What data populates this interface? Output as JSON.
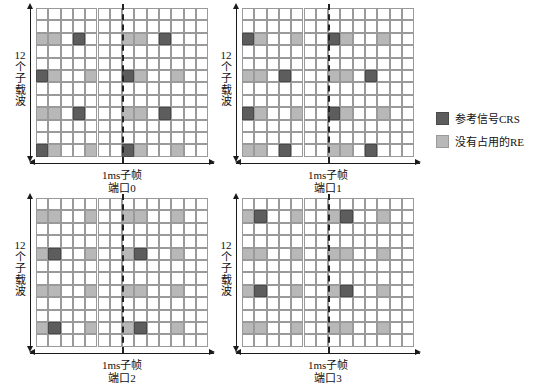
{
  "figure": {
    "subcarrier_count": 12,
    "symbol_count": 14,
    "colors": {
      "crs": "#5d5d5d",
      "free": "#b8b8b8",
      "empty": "#ffffff",
      "gridline": "#9a9a9a",
      "axis": "#1a1a1a",
      "divider": "#222222"
    }
  },
  "legend": {
    "items": [
      {
        "swatch": "crs",
        "label": "参考信号CRS"
      },
      {
        "swatch": "free",
        "label": "没有占用的RE"
      }
    ]
  },
  "axis_labels": {
    "y": "12个子载波",
    "y_chars": [
      "12",
      "个",
      "子",
      "载",
      "波"
    ],
    "x": "1ms子帧"
  },
  "chart_data": {
    "type": "heatmap",
    "xlabel": "1ms子帧",
    "ylabel": "12个子载波",
    "legend_position": "right",
    "grid": true,
    "cols": 14,
    "rows": 12,
    "col_axis": "OFDM symbol index (0-13)",
    "row_axis": "subcarrier index (row 0 = top)",
    "cell_states": [
      "empty",
      "free",
      "crs"
    ],
    "divider_after_col": 7,
    "panels": [
      {
        "id": "port0",
        "label": "端口0",
        "position": "top-left",
        "crs_cells": [
          [
            2,
            3
          ],
          [
            2,
            10
          ],
          [
            5,
            0
          ],
          [
            5,
            7
          ],
          [
            8,
            3
          ],
          [
            8,
            10
          ],
          [
            11,
            0
          ],
          [
            11,
            7
          ]
        ],
        "free_cells": [
          [
            2,
            0
          ],
          [
            2,
            1
          ],
          [
            2,
            7
          ],
          [
            2,
            8
          ],
          [
            5,
            1
          ],
          [
            5,
            4
          ],
          [
            5,
            8
          ],
          [
            5,
            11
          ],
          [
            8,
            0
          ],
          [
            8,
            1
          ],
          [
            8,
            7
          ],
          [
            8,
            8
          ],
          [
            11,
            1
          ],
          [
            11,
            4
          ],
          [
            11,
            8
          ],
          [
            11,
            11
          ]
        ]
      },
      {
        "id": "port1",
        "label": "端口1",
        "position": "top-right",
        "crs_cells": [
          [
            2,
            0
          ],
          [
            2,
            7
          ],
          [
            5,
            3
          ],
          [
            5,
            10
          ],
          [
            8,
            0
          ],
          [
            8,
            7
          ],
          [
            11,
            3
          ],
          [
            11,
            10
          ]
        ],
        "free_cells": [
          [
            2,
            1
          ],
          [
            2,
            4
          ],
          [
            2,
            8
          ],
          [
            2,
            11
          ],
          [
            5,
            0
          ],
          [
            5,
            1
          ],
          [
            5,
            7
          ],
          [
            5,
            8
          ],
          [
            8,
            1
          ],
          [
            8,
            4
          ],
          [
            8,
            8
          ],
          [
            8,
            11
          ],
          [
            11,
            0
          ],
          [
            11,
            1
          ],
          [
            11,
            7
          ],
          [
            11,
            8
          ]
        ]
      },
      {
        "id": "port2",
        "label": "端口2",
        "position": "bottom-left",
        "crs_cells": [
          [
            4,
            1
          ],
          [
            4,
            8
          ],
          [
            10,
            1
          ],
          [
            10,
            8
          ]
        ],
        "free_cells": [
          [
            1,
            0
          ],
          [
            1,
            1
          ],
          [
            1,
            4
          ],
          [
            1,
            7
          ],
          [
            1,
            8
          ],
          [
            1,
            11
          ],
          [
            4,
            0
          ],
          [
            4,
            4
          ],
          [
            4,
            7
          ],
          [
            4,
            11
          ],
          [
            7,
            0
          ],
          [
            7,
            1
          ],
          [
            7,
            4
          ],
          [
            7,
            7
          ],
          [
            7,
            8
          ],
          [
            7,
            11
          ],
          [
            10,
            0
          ],
          [
            10,
            4
          ],
          [
            10,
            7
          ],
          [
            10,
            11
          ]
        ]
      },
      {
        "id": "port3",
        "label": "端口3",
        "position": "bottom-right",
        "crs_cells": [
          [
            1,
            1
          ],
          [
            1,
            8
          ],
          [
            7,
            1
          ],
          [
            7,
            8
          ]
        ],
        "free_cells": [
          [
            1,
            0
          ],
          [
            1,
            4
          ],
          [
            1,
            7
          ],
          [
            1,
            11
          ],
          [
            4,
            0
          ],
          [
            4,
            1
          ],
          [
            4,
            4
          ],
          [
            4,
            7
          ],
          [
            4,
            8
          ],
          [
            4,
            11
          ],
          [
            7,
            0
          ],
          [
            7,
            4
          ],
          [
            7,
            7
          ],
          [
            7,
            11
          ],
          [
            10,
            0
          ],
          [
            10,
            1
          ],
          [
            10,
            4
          ],
          [
            10,
            7
          ],
          [
            10,
            8
          ],
          [
            10,
            11
          ]
        ]
      }
    ]
  }
}
